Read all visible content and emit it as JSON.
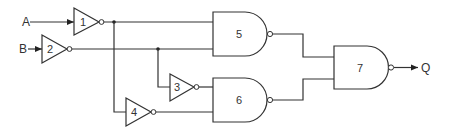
{
  "diagram": {
    "type": "logic-circuit",
    "inputs": [
      {
        "id": "A",
        "label": "A"
      },
      {
        "id": "B",
        "label": "B"
      }
    ],
    "outputs": [
      {
        "id": "Q",
        "label": "Q"
      }
    ],
    "gates": [
      {
        "id": "g1",
        "kind": "NOT",
        "label": "1",
        "inputs": [
          "A"
        ]
      },
      {
        "id": "g2",
        "kind": "NOT",
        "label": "2",
        "inputs": [
          "B"
        ]
      },
      {
        "id": "g3",
        "kind": "NOT",
        "label": "3",
        "inputs": [
          "g2"
        ]
      },
      {
        "id": "g4",
        "kind": "NOT",
        "label": "4",
        "inputs": [
          "g1"
        ]
      },
      {
        "id": "g5",
        "kind": "NAND",
        "label": "5",
        "inputs": [
          "g1",
          "g2"
        ]
      },
      {
        "id": "g6",
        "kind": "NAND",
        "label": "6",
        "inputs": [
          "g3",
          "g4"
        ]
      },
      {
        "id": "g7",
        "kind": "NAND",
        "label": "7",
        "inputs": [
          "g5",
          "g6"
        ]
      }
    ],
    "connections": [
      {
        "from": "A",
        "to": "g1"
      },
      {
        "from": "B",
        "to": "g2"
      },
      {
        "from": "g1",
        "to": "g5"
      },
      {
        "from": "g1",
        "to": "g4"
      },
      {
        "from": "g2",
        "to": "g5"
      },
      {
        "from": "g2",
        "to": "g3"
      },
      {
        "from": "g3",
        "to": "g6"
      },
      {
        "from": "g4",
        "to": "g6"
      },
      {
        "from": "g5",
        "to": "g7"
      },
      {
        "from": "g6",
        "to": "g7"
      },
      {
        "from": "g7",
        "to": "Q"
      }
    ]
  }
}
